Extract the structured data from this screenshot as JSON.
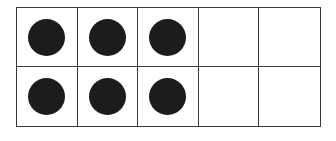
{
  "ten_frame": {
    "rows": 2,
    "columns": 5,
    "cells": [
      [
        true,
        true,
        true,
        false,
        false
      ],
      [
        true,
        true,
        true,
        false,
        false
      ]
    ],
    "filled_count": 6,
    "total_cells": 10,
    "dot_color": "#1c1c1c",
    "line_color": "#3a3a3a"
  }
}
